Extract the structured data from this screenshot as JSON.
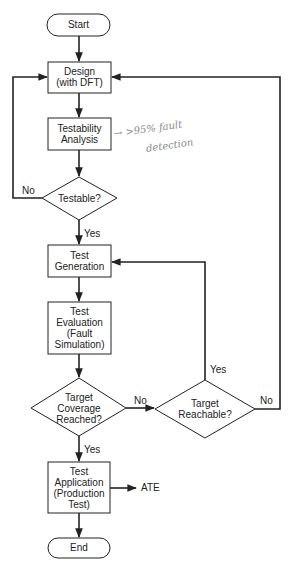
{
  "diagram": {
    "type": "flowchart",
    "colors": {
      "stroke": "#222222",
      "text": "#222222",
      "annotation": "#8a8a8a",
      "background": "#ffffff"
    },
    "nodes": {
      "start": {
        "shape": "terminator",
        "label": "Start"
      },
      "design": {
        "shape": "process",
        "label": "Design\n(with DFT)"
      },
      "testability": {
        "shape": "process",
        "label": "Testability\nAnalysis"
      },
      "testable": {
        "shape": "decision",
        "label": "Testable?"
      },
      "generation": {
        "shape": "process",
        "label": "Test\nGeneration"
      },
      "evaluation": {
        "shape": "process",
        "label": "Test\nEvaluation\n(Fault\nSimulation)"
      },
      "coverage": {
        "shape": "decision",
        "label": "Target\nCoverage\nReached?"
      },
      "reachable": {
        "shape": "decision",
        "label": "Target\nReachable?"
      },
      "application": {
        "shape": "process",
        "label": "Test\nApplication\n(Production\nTest)"
      },
      "end": {
        "shape": "terminator",
        "label": "End"
      }
    },
    "edge_labels": {
      "testable_no": "No",
      "testable_yes": "Yes",
      "coverage_no": "No",
      "coverage_yes": "Yes",
      "reachable_yes": "Yes",
      "reachable_no": "No",
      "ate": "ATE"
    },
    "annotation": {
      "line1": "→ >95% fault",
      "line2": "detection"
    },
    "edges": [
      {
        "from": "start",
        "to": "design"
      },
      {
        "from": "design",
        "to": "testability"
      },
      {
        "from": "testability",
        "to": "testable"
      },
      {
        "from": "testable",
        "to": "design",
        "label": "No"
      },
      {
        "from": "testable",
        "to": "generation",
        "label": "Yes"
      },
      {
        "from": "generation",
        "to": "evaluation"
      },
      {
        "from": "evaluation",
        "to": "coverage"
      },
      {
        "from": "coverage",
        "to": "reachable",
        "label": "No"
      },
      {
        "from": "coverage",
        "to": "application",
        "label": "Yes"
      },
      {
        "from": "reachable",
        "to": "generation",
        "label": "Yes"
      },
      {
        "from": "reachable",
        "to": "design",
        "label": "No"
      },
      {
        "from": "application",
        "to": "ATE"
      },
      {
        "from": "application",
        "to": "end"
      }
    ]
  }
}
